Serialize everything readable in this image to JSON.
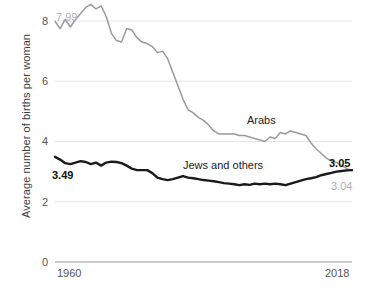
{
  "chart_data": {
    "type": "line",
    "title": "",
    "xlabel": "",
    "ylabel": "Average number of births per woman",
    "xlim": [
      1960,
      2018
    ],
    "ylim": [
      0,
      8.6
    ],
    "yticks": [
      0,
      2,
      4,
      6,
      8
    ],
    "ytick_labels": [
      "0",
      "2",
      "4",
      "6",
      "8"
    ],
    "xticks": [
      1960,
      2018
    ],
    "xtick_labels": [
      "1960",
      "2018"
    ],
    "grid": "horizontal",
    "legend": "inline-labels",
    "annotations": [
      {
        "text": "7.99",
        "series": "Arabs",
        "year": 1960,
        "value": 7.99,
        "style": "gray"
      },
      {
        "text": "3.49",
        "series": "Jews and others",
        "year": 1960,
        "value": 3.49,
        "style": "bold"
      },
      {
        "text": "3.05",
        "series": "Jews and others",
        "year": 2018,
        "value": 3.05,
        "style": "bold"
      },
      {
        "text": "3.04",
        "series": "Arabs",
        "year": 2018,
        "value": 3.04,
        "style": "gray"
      },
      {
        "text": "Arabs",
        "series": "Arabs",
        "style": "inline-label"
      },
      {
        "text": "Jews and others",
        "series": "Jews and others",
        "style": "inline-label"
      }
    ],
    "colors": {
      "Arabs": "#9a9a9a",
      "Jews and others": "#1a1a1a",
      "grid": "#e6e6e6",
      "axis": "#9a9a9a"
    },
    "x": [
      1960,
      1961,
      1962,
      1963,
      1964,
      1965,
      1966,
      1967,
      1968,
      1969,
      1970,
      1971,
      1972,
      1973,
      1974,
      1975,
      1976,
      1977,
      1978,
      1979,
      1980,
      1981,
      1982,
      1983,
      1984,
      1985,
      1986,
      1987,
      1988,
      1989,
      1990,
      1991,
      1992,
      1993,
      1994,
      1995,
      1996,
      1997,
      1998,
      1999,
      2000,
      2001,
      2002,
      2003,
      2004,
      2005,
      2006,
      2007,
      2008,
      2009,
      2010,
      2011,
      2012,
      2013,
      2014,
      2015,
      2016,
      2017,
      2018
    ],
    "series": [
      {
        "name": "Arabs",
        "color": "#9a9a9a",
        "values": [
          7.99,
          7.75,
          8.05,
          7.8,
          8.05,
          8.25,
          8.45,
          8.55,
          8.4,
          8.5,
          8.15,
          7.6,
          7.35,
          7.3,
          7.75,
          7.7,
          7.45,
          7.3,
          7.25,
          7.15,
          6.95,
          7.0,
          6.75,
          6.3,
          5.85,
          5.4,
          5.05,
          4.95,
          4.8,
          4.7,
          4.55,
          4.35,
          4.25,
          4.25,
          4.25,
          4.25,
          4.2,
          4.2,
          4.15,
          4.1,
          4.05,
          4.0,
          4.15,
          4.1,
          4.3,
          4.25,
          4.35,
          4.3,
          4.25,
          4.2,
          3.95,
          3.75,
          3.6,
          3.45,
          3.35,
          3.3,
          3.2,
          3.1,
          3.04
        ]
      },
      {
        "name": "Jews and others",
        "color": "#1a1a1a",
        "values": [
          3.49,
          3.4,
          3.28,
          3.25,
          3.3,
          3.35,
          3.32,
          3.25,
          3.3,
          3.2,
          3.3,
          3.33,
          3.32,
          3.28,
          3.2,
          3.1,
          3.05,
          3.05,
          3.05,
          2.95,
          2.8,
          2.75,
          2.72,
          2.75,
          2.8,
          2.85,
          2.8,
          2.78,
          2.75,
          2.72,
          2.7,
          2.68,
          2.65,
          2.62,
          2.6,
          2.58,
          2.55,
          2.58,
          2.56,
          2.6,
          2.58,
          2.6,
          2.58,
          2.6,
          2.58,
          2.55,
          2.6,
          2.65,
          2.7,
          2.75,
          2.78,
          2.82,
          2.88,
          2.92,
          2.96,
          3.0,
          3.02,
          3.04,
          3.05
        ]
      }
    ]
  },
  "axis": {
    "y_title": "Average number of births per woman",
    "y_ticks": [
      "8",
      "6",
      "4",
      "2",
      "0"
    ],
    "x_start": "1960",
    "x_end": "2018"
  },
  "labels": {
    "arabs": "Arabs",
    "jews": "Jews and others",
    "start_arabs": "7.99",
    "start_jews": "3.49",
    "end_jews": "3.05",
    "end_arabs": "3.04"
  }
}
